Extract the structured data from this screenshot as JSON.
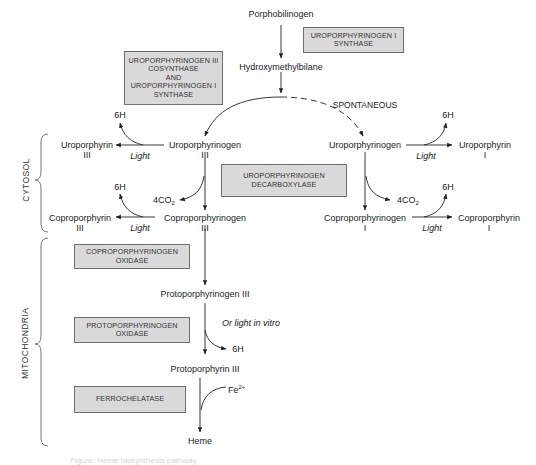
{
  "colors": {
    "enzyme_box_fill": "#d9d9d9",
    "enzyme_box_border": "#6f6f6f",
    "line": "#222222",
    "text": "#222222"
  },
  "compartments": {
    "cytosol": "CYTOSOL",
    "mitochondria": "MITOCHONDRIA"
  },
  "metabolites": {
    "porphobilinogen": "Porphobilinogen",
    "hydroxymethylbilane": "Hydroxymethylbilane",
    "uroporphyrinogen_iii": {
      "name": "Uroporphyrinogen",
      "isomer": "III"
    },
    "uroporphyrinogen_i": {
      "name": "Uroporphyrinogen",
      "isomer": "I"
    },
    "uroporphyrin_iii": {
      "name": "Uroporphyrin",
      "isomer": "III"
    },
    "uroporphyrin_i": {
      "name": "Uroporphyrin",
      "isomer": "I"
    },
    "coproporphyrinogen_iii": {
      "name": "Coproporphyrinogen",
      "isomer": "III"
    },
    "coproporphyrinogen_i": {
      "name": "Coproporphyrinogen",
      "isomer": "I"
    },
    "coproporphyrin_iii": {
      "name": "Coproporphyrin",
      "isomer": "III"
    },
    "coproporphyrin_i": {
      "name": "Coproporphyrin",
      "isomer": "I"
    },
    "protoporphyrinogen_iii": "Protoporphyrinogen III",
    "protoporphyrin_iii": "Protoporphyrin III",
    "heme": "Heme"
  },
  "enzymes": {
    "uro_iii_cosynthase": [
      "UROPORPHYRINOGEN III",
      "COSYNTHASE",
      "AND",
      "UROPORPHYRINOGEN I",
      "SYNTHASE"
    ],
    "uro_i_synthase": [
      "UROPORPHYRINOGEN I",
      "SYNTHASE"
    ],
    "uro_decarboxylase": [
      "UROPORPHYRINOGEN",
      "DECARBOXYLASE"
    ],
    "copro_oxidase": [
      "COPROPORPHYRINOGEN",
      "OXIDASE"
    ],
    "proto_oxidase": [
      "PROTOPORPHYRINOGEN",
      "OXIDASE"
    ],
    "ferrochelatase": [
      "FERROCHELATASE"
    ]
  },
  "side_labels": {
    "spontaneous": "SPONTANEOUS",
    "light": "Light",
    "six_h": "6H",
    "co2_prefix": "4CO",
    "co2_sub": "2",
    "or_light_in_vitro": "Or light in vitro",
    "fe_base": "Fe",
    "fe_charge": "2+"
  },
  "caption": "Figure: Heme biosynthesis pathway"
}
